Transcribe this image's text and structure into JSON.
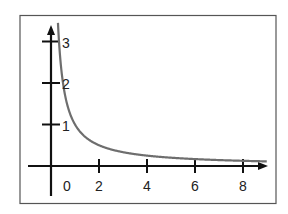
{
  "chart_data": {
    "type": "line",
    "title": "",
    "xlabel": "",
    "ylabel": "",
    "function": "y = 1/x",
    "x_ticks": [
      0,
      2,
      4,
      6,
      8
    ],
    "y_ticks": [
      1,
      2,
      3
    ],
    "xlim": [
      -0.3,
      9
    ],
    "ylim": [
      -0.6,
      3.3
    ],
    "grid": false,
    "series": [
      {
        "name": "y = 1/x",
        "x": [
          0.3,
          0.33,
          0.5,
          0.75,
          1,
          1.5,
          2,
          3,
          4,
          5,
          6,
          7,
          8,
          9
        ],
        "y": [
          3.33,
          3.0,
          2.0,
          1.33,
          1.0,
          0.67,
          0.5,
          0.33,
          0.25,
          0.2,
          0.17,
          0.14,
          0.125,
          0.11
        ]
      }
    ],
    "colors": {
      "axis": "#111111",
      "curve": "#6e6e6e",
      "frame": "#555555"
    }
  },
  "labels": {
    "x": [
      "0",
      "2",
      "4",
      "6",
      "8"
    ],
    "y": [
      "1",
      "2",
      "3"
    ]
  }
}
